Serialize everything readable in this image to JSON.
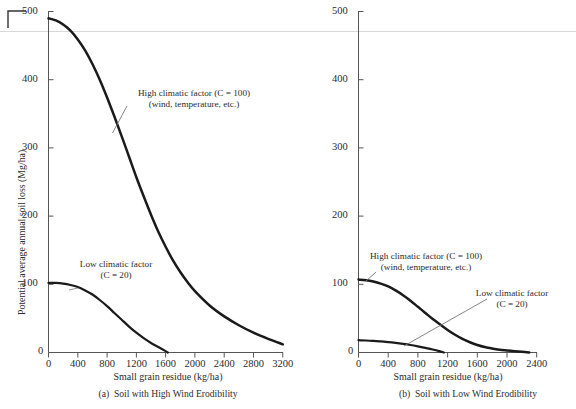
{
  "figure": {
    "background": "#ffffff",
    "ink": "#2b2b2b",
    "curve_color": "#1a1a1a",
    "axis_color": "#555555",
    "leader_color": "#777777",
    "crop_mark_color": "#333333"
  },
  "shared": {
    "y_axis_label": "Potential average annual soil loss (Mg/ha)",
    "x_axis_label": "Small grain residue (kg/ha)",
    "y_ticks": [
      0,
      100,
      200,
      300,
      400,
      500
    ],
    "y_tick_labels": [
      "0",
      "100",
      "200",
      "300",
      "400",
      "500"
    ],
    "annotation_high_line1": "High climatic factor (C = 100)",
    "annotation_high_line2": "(wind, temperature, etc.)",
    "annotation_low_line1": "Low climatic factor",
    "annotation_low_line2": "(C = 20)"
  },
  "panel_a": {
    "caption": "(a)  Soil with High Wind Erodibility",
    "x_ticks": [
      0,
      400,
      800,
      1200,
      1600,
      2000,
      2400,
      2800,
      3200
    ],
    "x_tick_labels": [
      "0",
      "400",
      "800",
      "1200",
      "1600",
      "2000",
      "2400",
      "2800",
      "3200"
    ]
  },
  "panel_b": {
    "caption": "(b)  Soil with Low Wind Erodibility",
    "x_ticks": [
      0,
      400,
      800,
      1200,
      1600,
      2000,
      2400
    ],
    "x_tick_labels": [
      "0",
      "400",
      "800",
      "1200",
      "1600",
      "2000",
      "2400"
    ]
  },
  "chart_data": [
    {
      "type": "line",
      "id": "panel-a",
      "title": "(a)  Soil with High Wind Erodibility",
      "xlabel": "Small grain residue (kg/ha)",
      "ylabel": "Potential average annual soil loss (Mg/ha)",
      "xlim": [
        0,
        3200
      ],
      "ylim": [
        0,
        500
      ],
      "xticks": [
        0,
        400,
        800,
        1200,
        1600,
        2000,
        2400,
        2800,
        3200
      ],
      "yticks": [
        0,
        100,
        200,
        300,
        400,
        500
      ],
      "grid": false,
      "legend": "annotations-on-plot",
      "series": [
        {
          "name": "High climatic factor (C = 100) (wind, temperature, etc.)",
          "x": [
            0,
            100,
            200,
            300,
            400,
            500,
            600,
            700,
            800,
            900,
            1000,
            1100,
            1200,
            1300,
            1400,
            1500,
            1600,
            1700,
            1800,
            1900,
            2000,
            2200,
            2400,
            2600,
            2800,
            3000,
            3200
          ],
          "y": [
            490,
            487,
            481,
            472,
            459,
            443,
            423,
            400,
            374,
            346,
            317,
            287,
            257,
            229,
            202,
            177,
            155,
            135,
            118,
            103,
            90,
            69,
            53,
            40,
            29,
            20,
            12
          ]
        },
        {
          "name": "Low climatic factor (C = 20)",
          "x": [
            0,
            100,
            200,
            300,
            400,
            500,
            600,
            700,
            800,
            900,
            1000,
            1100,
            1200,
            1300,
            1400,
            1500,
            1600,
            1630
          ],
          "y": [
            102,
            102,
            101,
            99,
            96,
            91,
            85,
            77,
            68,
            58,
            48,
            38,
            29,
            21,
            14,
            8,
            2,
            0
          ]
        }
      ]
    },
    {
      "type": "line",
      "id": "panel-b",
      "title": "(b)  Soil with Low Wind Erodibility",
      "xlabel": "Small grain residue (kg/ha)",
      "ylabel": "Potential average annual soil loss (Mg/ha)",
      "xlim": [
        0,
        2400
      ],
      "ylim": [
        0,
        500
      ],
      "xticks": [
        0,
        400,
        800,
        1200,
        1600,
        2000,
        2400
      ],
      "yticks": [
        0,
        100,
        200,
        300,
        400,
        500
      ],
      "grid": false,
      "legend": "annotations-on-plot",
      "series": [
        {
          "name": "High climatic factor (C = 100) (wind, temperature, etc.)",
          "x": [
            0,
            100,
            200,
            300,
            400,
            500,
            600,
            700,
            800,
            900,
            1000,
            1100,
            1200,
            1300,
            1400,
            1500,
            1600,
            1700,
            1800,
            1900,
            2000,
            2100,
            2200,
            2300
          ],
          "y": [
            107,
            106,
            104,
            101,
            97,
            91,
            84,
            76,
            67,
            58,
            49,
            41,
            33,
            26,
            20,
            15,
            11,
            8,
            6,
            4,
            3,
            2,
            1,
            0
          ]
        },
        {
          "name": "Low climatic factor (C = 20)",
          "x": [
            0,
            100,
            200,
            300,
            400,
            500,
            600,
            700,
            800,
            900,
            1000,
            1100,
            1150
          ],
          "y": [
            18,
            17.6,
            17,
            16.2,
            15.2,
            14,
            12.6,
            11,
            9,
            6.8,
            4.4,
            1.6,
            0
          ]
        }
      ]
    }
  ]
}
